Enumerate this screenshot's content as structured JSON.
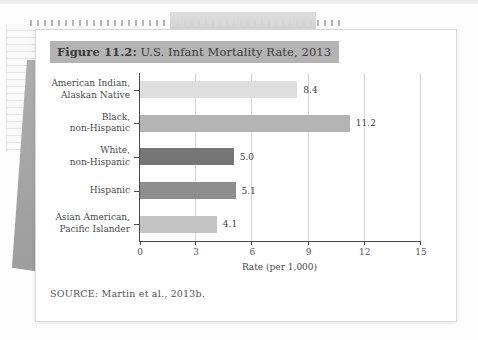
{
  "page": {
    "figure_label": "Figure 11.2:",
    "figure_title_rest": " U.S. Infant Mortality Rate, 2013",
    "source": "SOURCE: Martin et al., 2013b.",
    "title_highlight_color": "#b3b3b3"
  },
  "chart_data": {
    "type": "bar",
    "orientation": "horizontal",
    "title": "Figure 11.2: U.S. Infant Mortality Rate, 2013",
    "categories": [
      "American Indian,\nAlaskan Native",
      "Black,\nnon-Hispanic",
      "White,\nnon-Hispanic",
      "Hispanic",
      "Asian American,\nPacific Islander"
    ],
    "values": [
      8.4,
      11.2,
      5.0,
      5.1,
      4.1
    ],
    "value_labels": [
      "8.4",
      "11.2",
      "5.0",
      "5.1",
      "4.1"
    ],
    "bar_colors": [
      "#dedede",
      "#b4b4b4",
      "#767676",
      "#8e8e8e",
      "#c4c4c4"
    ],
    "xlabel": "Rate (per 1,000)",
    "xlim": [
      0,
      15
    ],
    "xticks": [
      0,
      3,
      6,
      9,
      12,
      15
    ],
    "grid": true,
    "legend": false
  }
}
